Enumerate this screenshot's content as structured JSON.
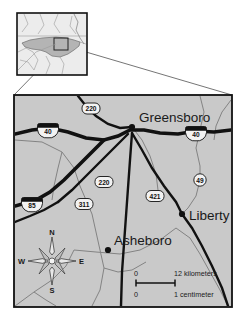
{
  "figure": {
    "type": "locator-map",
    "region": "North Carolina Piedmont Triad",
    "background_color": "#ffffff"
  },
  "inset": {
    "name": "state-locator-inset",
    "state_fill": "#b4b4b4",
    "land_fill": "#e3e3e3",
    "border_color": "#111111",
    "highlight_box_label": "detail area"
  },
  "main_map": {
    "background_color": "#c9c9c9",
    "border_color": "#111111",
    "road_color_major": "#111111",
    "road_color_minor": "#7c7c7c",
    "cities": [
      {
        "name": "Greensboro",
        "x": 132,
        "y": 127
      },
      {
        "name": "Liberty",
        "x": 182,
        "y": 214
      },
      {
        "name": "Asheboro",
        "x": 108,
        "y": 250
      }
    ],
    "route_markers": [
      {
        "label": "220",
        "shape": "oval",
        "x": 91,
        "y": 108
      },
      {
        "label": "40",
        "shape": "interstate",
        "x": 48,
        "y": 128
      },
      {
        "label": "40",
        "shape": "interstate",
        "x": 196,
        "y": 131
      },
      {
        "label": "220",
        "shape": "oval",
        "x": 104,
        "y": 182
      },
      {
        "label": "311",
        "shape": "oval",
        "x": 84,
        "y": 204
      },
      {
        "label": "85",
        "shape": "interstate",
        "x": 32,
        "y": 202
      },
      {
        "label": "421",
        "shape": "oval",
        "x": 155,
        "y": 196
      },
      {
        "label": "49",
        "shape": "circle",
        "x": 200,
        "y": 180
      }
    ]
  },
  "compass": {
    "name": "compass-rose",
    "north": "N",
    "east": "E",
    "south": "S",
    "west": "W"
  },
  "scale_bar": {
    "km_zero": "0",
    "km_max": "12 kilometers",
    "cm_zero": "0",
    "cm_max": "1 centimeter"
  }
}
